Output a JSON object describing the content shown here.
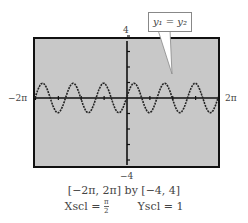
{
  "chart_data": {
    "type": "line",
    "title": "",
    "function": "y1 = y2 (approximately sin(3x))",
    "callout": "y1 = y2",
    "xlim_label": [
      "-2π",
      "2π"
    ],
    "xlim": [
      -6.2832,
      6.2832
    ],
    "ylim": [
      -4,
      4
    ],
    "xscl": "π/2",
    "yscl": 1,
    "grid": false,
    "x": [
      -6.2832,
      -5.7596,
      -5.236,
      -4.7124,
      -4.1888,
      -3.6652,
      -3.1416,
      -2.618,
      -2.0944,
      -1.5708,
      -1.0472,
      -0.5236,
      0,
      0.5236,
      1.0472,
      1.5708,
      2.0944,
      2.618,
      3.1416,
      3.6652,
      4.1888,
      4.7124,
      5.236,
      5.7596,
      6.2832
    ],
    "y": [
      0,
      1,
      0,
      -1,
      0,
      1,
      0,
      -1,
      0,
      1,
      0,
      -1,
      0,
      1,
      0,
      -1,
      0,
      1,
      0,
      -1,
      0,
      1,
      0,
      -1,
      0
    ],
    "background": "#c8c8c8",
    "line_color": "#222222"
  },
  "labels": {
    "ymax": "4",
    "ymin": "−4",
    "xmin": "−2π",
    "xmax": "2π",
    "callout": "y₁ = y₂"
  },
  "caption": {
    "window": "[−2π, 2π]  by  [−4, 4]",
    "xscl_prefix": "Xscl =",
    "xscl_num": "π",
    "xscl_den": "2",
    "yscl": "Yscl = 1"
  }
}
